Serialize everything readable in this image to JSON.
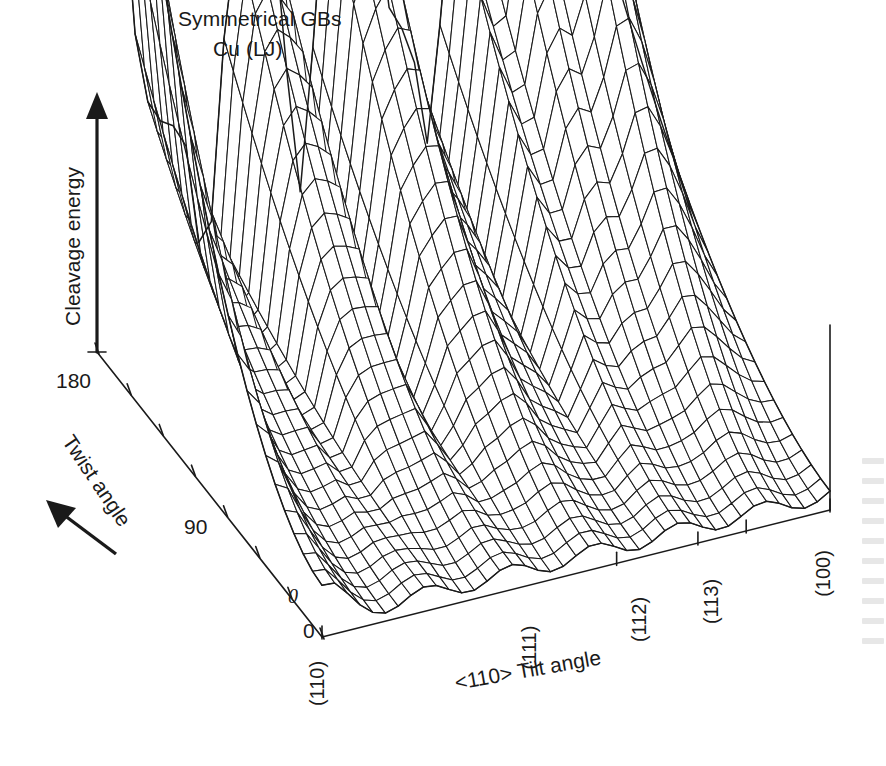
{
  "figure": {
    "title_line1": "Symmetrical GBs",
    "title_line2": "Cu (LJ)",
    "background": "#ffffff",
    "ink": "#1a1a1a"
  },
  "axes": {
    "y_label": "Cleavage energy",
    "twist_label": "Twist angle",
    "tilt_label": "<110> Tilt angle",
    "twist_ticks": [
      "180",
      "90",
      "0"
    ],
    "twist_tick_zero_style": "italic",
    "tilt_ticks": [
      "(110)",
      "(111)",
      "(112)",
      "(113)",
      "(100)"
    ],
    "y_axis_arrow": "up-arrow-icon",
    "twist_direction_arrow": "direction-arrow-icon"
  },
  "chart_data": {
    "type": "surface",
    "title": "Symmetrical GBs Cu (LJ)",
    "xlabel": "<110> Tilt angle",
    "ylabel": "Twist angle",
    "zlabel": "Cleavage energy",
    "grid": false,
    "legend": "none",
    "x_tick_labels": [
      "(110)",
      "(111)",
      "(112)",
      "(113)",
      "(100)"
    ],
    "x_tick_positions": [
      0.0,
      0.58,
      0.74,
      0.835,
      1.0
    ],
    "y_tick_labels": [
      "0",
      "90",
      "180"
    ],
    "y_tick_positions": [
      0.0,
      0.5,
      1.0
    ],
    "x_range": [
      0,
      1
    ],
    "y_range": [
      0,
      180
    ],
    "z_range": [
      0,
      1
    ],
    "nx": 41,
    "ny": 25,
    "cusp_x_positions": [
      0.0,
      0.215,
      0.4,
      0.58,
      0.655,
      0.74,
      0.835,
      1.0
    ],
    "cusp_x_depths": [
      0.0,
      0.6,
      0.52,
      0.18,
      0.55,
      0.42,
      0.3,
      0.1
    ],
    "peak_x_positions": [
      0.3,
      0.5,
      0.7,
      0.79,
      0.9
    ],
    "peak_x_heights": [
      0.47,
      0.62,
      0.4,
      0.44,
      0.86
    ],
    "twist_profile_note": "energy rises strongly toward twist = 180 (back edge) and is flat/low near twist = 0"
  },
  "view": {
    "origin_x": 322,
    "origin_y": 637,
    "axis_top_x": 97,
    "axis_top_y": 352,
    "x_axis_end_x": 830,
    "x_axis_end_y": 510,
    "z_height": 470
  }
}
